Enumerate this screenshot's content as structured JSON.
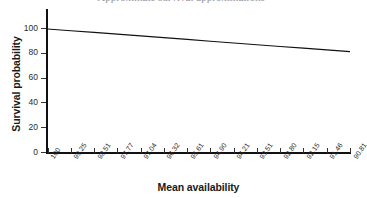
{
  "chart_data": {
    "type": "line",
    "title": "Approximate survival approximations",
    "xlabel": "Mean availability",
    "ylabel": "Survival probability",
    "x_tick_labels": [
      "100",
      "99.25",
      "98.51",
      "97.77",
      "97.04",
      "96.32",
      "95.61",
      "94.90",
      "94.21",
      "93.51",
      "92.80",
      "92.15",
      "91.46",
      "90.81"
    ],
    "x_values": [
      100,
      99.25,
      98.51,
      97.77,
      97.04,
      96.32,
      95.61,
      94.9,
      94.21,
      93.51,
      92.8,
      92.15,
      91.46,
      90.81
    ],
    "y_tick_labels": [
      "0",
      "20",
      "40",
      "60",
      "80",
      "100"
    ],
    "y_ticks": [
      0,
      20,
      40,
      60,
      80,
      100
    ],
    "ylim": [
      0,
      100
    ],
    "grid": false,
    "legend": false,
    "series": [
      {
        "name": "Survival probability",
        "color": "#111111",
        "values": [
          99.2,
          97.8,
          96.4,
          95.0,
          93.6,
          92.2,
          90.8,
          89.3,
          87.9,
          86.5,
          85.1,
          83.7,
          82.3,
          80.9
        ]
      }
    ]
  }
}
